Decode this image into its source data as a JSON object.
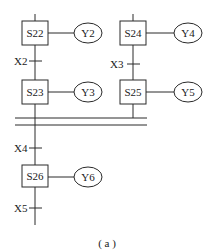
{
  "diagram": {
    "type": "SFC parallel branch (sequential function chart)",
    "caption": "( a )",
    "left_branch": {
      "steps": [
        {
          "id": "S22",
          "output": "Y2"
        },
        {
          "id": "S23",
          "output": "Y3"
        }
      ],
      "transitions": [
        "X2"
      ]
    },
    "right_branch": {
      "steps": [
        {
          "id": "S24",
          "output": "Y4"
        },
        {
          "id": "S25",
          "output": "Y5"
        }
      ],
      "transitions": [
        "X3"
      ]
    },
    "merge": {
      "transition": "X4",
      "step": {
        "id": "S26",
        "output": "Y6"
      },
      "next_transition": "X5"
    }
  }
}
